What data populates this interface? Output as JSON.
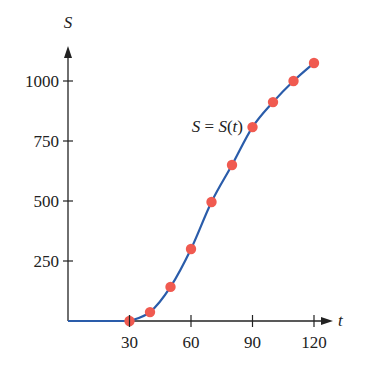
{
  "chart_data": {
    "type": "line",
    "title": "",
    "xlabel": "t",
    "ylabel": "S",
    "xlim": [
      0,
      125
    ],
    "ylim": [
      0,
      1150
    ],
    "xticks": [
      30,
      60,
      90,
      120
    ],
    "yticks": [
      250,
      500,
      750,
      1000
    ],
    "xtick_labels": [
      "30",
      "60",
      "90",
      "120"
    ],
    "ytick_labels": [
      "250",
      "500",
      "750",
      "1000"
    ],
    "grid": false,
    "legend": null,
    "annotation": {
      "text_prefix": "S = S(",
      "var": "t",
      "text_suffix": ")",
      "full": "S = S(t)",
      "at": [
        90,
        808
      ]
    },
    "series": [
      {
        "name": "S = S(t)",
        "color": "#2A5CAA",
        "marker_color": "#F05A50",
        "curve_start": [
          0,
          0
        ],
        "x": [
          30,
          40,
          50,
          60,
          70,
          80,
          90,
          100,
          110,
          120
        ],
        "values": [
          0,
          37,
          142,
          300,
          496,
          650,
          808,
          912,
          1000,
          1075
        ]
      }
    ]
  },
  "labels": {
    "x_axis": "t",
    "y_axis": "S",
    "annotation": "S = S(t)"
  }
}
